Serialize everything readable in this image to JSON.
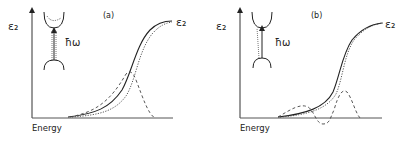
{
  "panels": [
    {
      "id": "a",
      "label": "(a)",
      "y_axis_label": "ε₂",
      "x_axis_label": "Energy",
      "curve_label": "ε₂",
      "photon_label": "ħω",
      "description": "Band transition diagram with solid, dashed and dotted epsilon2 curves; dashed difference peak near absorption edge"
    },
    {
      "id": "b",
      "label": "(b)",
      "y_axis_label": "ε₂",
      "x_axis_label": "Energy",
      "curve_label": "ε₂",
      "photon_label": "ħω",
      "description": "Band transition diagram with solid and dotted epsilon2 curves; dashed derivative-like oscillation with negative dip and positive peak"
    }
  ],
  "legend": {
    "solid": "epsilon2 (reference)",
    "dotted": "epsilon2 (shifted)",
    "dashed": "difference signal"
  }
}
